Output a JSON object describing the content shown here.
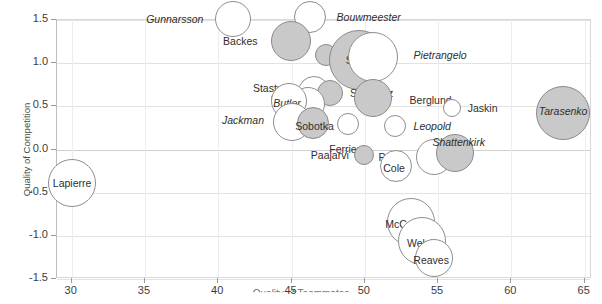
{
  "chart_data": {
    "type": "scatter",
    "title": "",
    "xlabel": "Quality of Teammates",
    "ylabel": "Quality of Competition",
    "xlim": [
      29.0,
      65.5
    ],
    "ylim": [
      -1.5,
      1.5
    ],
    "xticks": [
      30,
      35,
      40,
      45,
      50,
      55,
      60,
      65
    ],
    "yticks": [
      1.5,
      1.0,
      0.5,
      0.0,
      -0.5,
      -1.0,
      -1.5
    ],
    "xtick_labels": [
      "30",
      "35",
      "40",
      "45",
      "50",
      "55",
      "60",
      "65"
    ],
    "ytick_labels": [
      "1.5",
      "1.0",
      "0.5",
      "0.0",
      "-0.5",
      "-1.0",
      "-1.5"
    ],
    "grid": true,
    "legend": "none",
    "bubble_encoding": "marker size encodes a third variable; open markers and filled grey markers distinguish two groups",
    "points": [
      {
        "label": "Gunnarsson",
        "x": 41.1,
        "y": 1.5,
        "size": 18,
        "fill": "open",
        "italic": true,
        "anchor": "r",
        "dx": -12,
        "dy": 0
      },
      {
        "label": "Bouwmeester",
        "x": 46.3,
        "y": 1.52,
        "size": 16,
        "fill": "open",
        "italic": true,
        "anchor": "l",
        "dx": 11,
        "dy": 0
      },
      {
        "label": "Backes",
        "x": 45.0,
        "y": 1.24,
        "size": 20,
        "fill": "fill",
        "italic": false,
        "anchor": "r",
        "dx": -13,
        "dy": 0
      },
      {
        "label": "Oshie",
        "x": 47.4,
        "y": 1.08,
        "size": 11,
        "fill": "fill",
        "italic": false,
        "anchor": "l",
        "dx": 8,
        "dy": 0
      },
      {
        "label": "Steen",
        "x": 49.7,
        "y": 1.03,
        "size": 30,
        "fill": "fill",
        "italic": false,
        "anchor": "c",
        "dx": 0,
        "dy": 0
      },
      {
        "label": "Pietrangelo",
        "x": 50.6,
        "y": 1.06,
        "size": 25,
        "fill": "open",
        "italic": true,
        "anchor": "l",
        "dx": 16,
        "dy": -2
      },
      {
        "label": "Stastny",
        "x": 46.6,
        "y": 0.66,
        "size": 16,
        "fill": "open",
        "italic": false,
        "anchor": "r",
        "dx": -10,
        "dy": -4
      },
      {
        "label": "Schwartz",
        "x": 47.7,
        "y": 0.64,
        "size": 13,
        "fill": "fill",
        "italic": false,
        "anchor": "l",
        "dx": 7,
        "dy": 0
      },
      {
        "label": "Berglund",
        "x": 50.6,
        "y": 0.59,
        "size": 19,
        "fill": "fill",
        "italic": false,
        "anchor": "l",
        "dx": 18,
        "dy": 2
      },
      {
        "label": "Ott",
        "x": 46.2,
        "y": 0.52,
        "size": 17,
        "fill": "open",
        "italic": false,
        "anchor": "r",
        "dx": -6,
        "dy": -6
      },
      {
        "label": "Butler",
        "x": 44.9,
        "y": 0.55,
        "size": 18,
        "fill": "open",
        "italic": true,
        "anchor": "c",
        "dx": -2,
        "dy": 2
      },
      {
        "label": "Jaskin",
        "x": 56.0,
        "y": 0.47,
        "size": 9,
        "fill": "open",
        "italic": false,
        "anchor": "l",
        "dx": 7,
        "dy": 0
      },
      {
        "label": "Tarasenko",
        "x": 63.6,
        "y": 0.41,
        "size": 27,
        "fill": "fill",
        "italic": true,
        "anchor": "c",
        "dx": 0,
        "dy": -2
      },
      {
        "label": "Jackman",
        "x": 45.1,
        "y": 0.31,
        "size": 19,
        "fill": "open",
        "italic": true,
        "anchor": "r",
        "dx": -9,
        "dy": -2
      },
      {
        "label": "Sobotka",
        "x": 46.5,
        "y": 0.29,
        "size": 16,
        "fill": "fill",
        "italic": false,
        "anchor": "c",
        "dx": 2,
        "dy": 3
      },
      {
        "label": "Ferriero",
        "x": 48.9,
        "y": 0.28,
        "size": 11,
        "fill": "open",
        "italic": false,
        "anchor": "b",
        "dx": 0,
        "dy": 9
      },
      {
        "label": "Leopold",
        "x": 52.1,
        "y": 0.26,
        "size": 11,
        "fill": "open",
        "italic": true,
        "anchor": "l",
        "dx": 8,
        "dy": 0
      },
      {
        "label": "Lapierre",
        "x": 30.1,
        "y": -0.4,
        "size": 24,
        "fill": "open",
        "italic": false,
        "anchor": "c",
        "dx": 0,
        "dy": 0
      },
      {
        "label": "Paajarvi",
        "x": 50.0,
        "y": -0.08,
        "size": 10,
        "fill": "fill",
        "italic": false,
        "anchor": "r",
        "dx": -5,
        "dy": 0
      },
      {
        "label": "Porter",
        "x": 54.8,
        "y": -0.1,
        "size": 18,
        "fill": "open",
        "italic": false,
        "anchor": "r",
        "dx": -9,
        "dy": 0
      },
      {
        "label": "Shattenkirk",
        "x": 56.2,
        "y": -0.05,
        "size": 19,
        "fill": "fill",
        "italic": true,
        "anchor": "c",
        "dx": 4,
        "dy": -11
      },
      {
        "label": "Cole",
        "x": 52.2,
        "y": -0.2,
        "size": 16,
        "fill": "open",
        "italic": false,
        "anchor": "c",
        "dx": -2,
        "dy": 2
      },
      {
        "label": "McCarthy",
        "x": 53.2,
        "y": -0.85,
        "size": 24,
        "fill": "open",
        "italic": false,
        "anchor": "c",
        "dx": -3,
        "dy": 2
      },
      {
        "label": "Welsh",
        "x": 54.0,
        "y": -1.07,
        "size": 24,
        "fill": "open",
        "italic": false,
        "anchor": "c",
        "dx": -1,
        "dy": 2
      },
      {
        "label": "Reaves",
        "x": 54.8,
        "y": -1.27,
        "size": 19,
        "fill": "open",
        "italic": false,
        "anchor": "c",
        "dx": -3,
        "dy": 2
      }
    ]
  }
}
